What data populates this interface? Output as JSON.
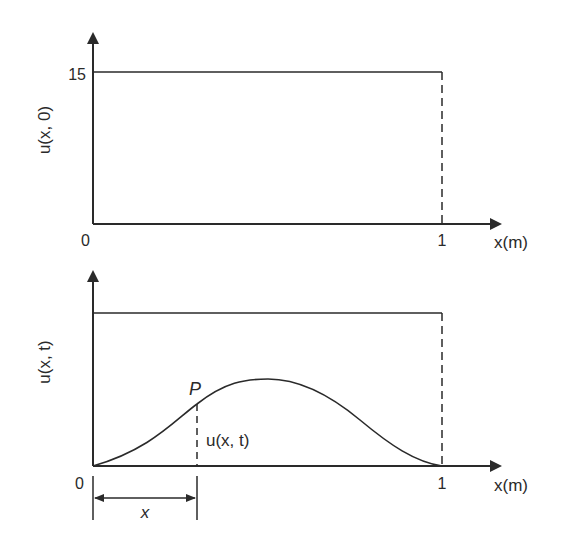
{
  "top_plot": {
    "y_label": "u(x, 0)",
    "y_tick": "15",
    "origin": "0",
    "x_tick": "1",
    "x_label": "x(m)",
    "description": "Initial temperature distribution: constant 15 over 0 ≤ x ≤ 1"
  },
  "bottom_plot": {
    "y_label": "u(x, t)",
    "origin": "0",
    "x_tick": "1",
    "x_label": "x(m)",
    "point_label": "P",
    "point_value_label": "u(x, t)",
    "dimension_label": "x",
    "description": "Temperature at a later time: bell-shaped curve from 0 to 1, below the initial level"
  },
  "colors": {
    "line": "#2a2a2a",
    "background": "#ffffff"
  }
}
